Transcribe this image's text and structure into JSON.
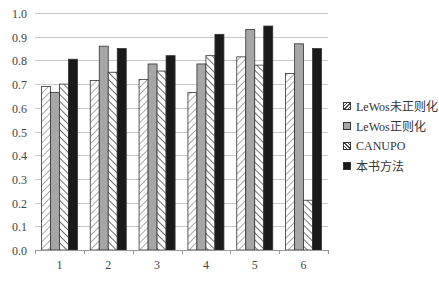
{
  "chart_data": {
    "type": "bar",
    "title": "",
    "xlabel": "",
    "ylabel": "",
    "ylim": [
      0.0,
      1.0
    ],
    "yticks": [
      "0.0",
      "0.1",
      "0.2",
      "0.3",
      "0.4",
      "0.5",
      "0.6",
      "0.7",
      "0.8",
      "0.9",
      "1.0"
    ],
    "grid": true,
    "legend_position": "right",
    "categories": [
      "1",
      "2",
      "3",
      "4",
      "5",
      "6"
    ],
    "series": [
      {
        "name": "LeWos未正则化",
        "pattern": "diagonal-hatch-forward",
        "color": "#ffffff",
        "values": [
          0.69,
          0.715,
          0.72,
          0.665,
          0.815,
          0.745
        ]
      },
      {
        "name": "LeWos正则化",
        "pattern": "solid",
        "color": "#a6a6a6",
        "values": [
          0.665,
          0.86,
          0.785,
          0.785,
          0.93,
          0.87
        ]
      },
      {
        "name": "CANUPO",
        "pattern": "diagonal-hatch-backward",
        "color": "#ffffff",
        "values": [
          0.7,
          0.75,
          0.755,
          0.82,
          0.78,
          0.21
        ]
      },
      {
        "name": "本书方法",
        "pattern": "solid",
        "color": "#1a1a1a",
        "values": [
          0.805,
          0.85,
          0.82,
          0.91,
          0.945,
          0.85
        ]
      }
    ]
  },
  "legend": {
    "items": [
      {
        "label": "LeWos未正则化"
      },
      {
        "label": "LeWos正则化"
      },
      {
        "label": "CANUPO"
      },
      {
        "label": "本书方法"
      }
    ]
  }
}
